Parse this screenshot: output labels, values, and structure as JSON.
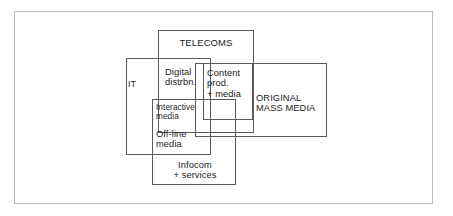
{
  "diagram": {
    "frame_color": "#b9b9b9",
    "box_color": "#5a5a62",
    "background": "#ffffff",
    "boxes": [
      {
        "id": "telecoms",
        "label": "TELECOMS",
        "x": 158,
        "y": 30,
        "w": 96,
        "h": 103
      },
      {
        "id": "it",
        "label": "IT",
        "x": 126,
        "y": 58,
        "w": 85,
        "h": 97
      },
      {
        "id": "digital",
        "label": "Digital\ndistrbn.",
        "x": 0,
        "y": 0,
        "w": 0,
        "h": 0
      },
      {
        "id": "mass-media",
        "label": "ORIGINAL\nMASS MEDIA",
        "x": 195,
        "y": 63,
        "w": 132,
        "h": 74
      },
      {
        "id": "content",
        "label": "Content\nprod.\n+ media",
        "x": 203,
        "y": 63,
        "w": 50,
        "h": 57
      },
      {
        "id": "infocom",
        "label": "Infocom\n+ services",
        "x": 152,
        "y": 99,
        "w": 84,
        "h": 86
      }
    ],
    "labels": {
      "telecoms": "TELECOMS",
      "it": "IT",
      "digital_distribution": "Digital\ndistrbn.",
      "content_production": "Content\nprod.\n+ media",
      "original_mass_media": "ORIGINAL\nMASS MEDIA",
      "interactive_media": "Interactive\nmedia",
      "offline_media": "Off-line\nmedia",
      "infocom_services": "Infocom\n+ services"
    }
  }
}
